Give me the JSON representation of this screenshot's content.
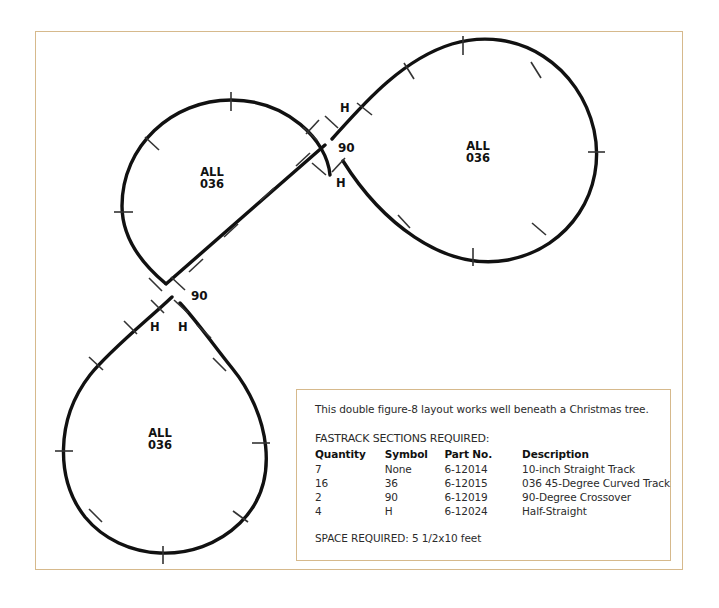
{
  "page": {
    "background": "#ffffff",
    "frame_border_color": "#d6b98c",
    "track_color": "#111111"
  },
  "diagram": {
    "name": "double-figure-8-fastrack-layout",
    "loop_labels": [
      {
        "id": "upper-left-loop",
        "line1": "ALL",
        "line2": "036",
        "x": 200,
        "y": 166
      },
      {
        "id": "upper-right-loop",
        "line1": "ALL",
        "line2": "036",
        "x": 466,
        "y": 140
      },
      {
        "id": "lower-left-loop",
        "line1": "ALL",
        "line2": "036",
        "x": 148,
        "y": 427
      }
    ],
    "crossing_labels": [
      {
        "id": "upper-crossover",
        "text": "90",
        "x": 338,
        "y": 141
      },
      {
        "id": "lower-crossover",
        "text": "90",
        "x": 191,
        "y": 289
      }
    ],
    "half_straight_labels": [
      {
        "id": "h-upper-top",
        "text": "H",
        "x": 340,
        "y": 101
      },
      {
        "id": "h-upper-bottom",
        "text": "H",
        "x": 336,
        "y": 176
      },
      {
        "id": "h-lower-left",
        "text": "H",
        "x": 150,
        "y": 320
      },
      {
        "id": "h-lower-right",
        "text": "H",
        "x": 178,
        "y": 320
      }
    ]
  },
  "legend": {
    "intro": "This double figure-8 layout works well beneath a Christmas tree.",
    "heading": "FASTRACK SECTIONS REQUIRED:",
    "columns": [
      "Quantity",
      "Symbol",
      "Part No.",
      "Description"
    ],
    "rows": [
      {
        "quantity": "7",
        "symbol": "None",
        "part_no": "6-12014",
        "description": "10-inch Straight Track"
      },
      {
        "quantity": "16",
        "symbol": "36",
        "part_no": "6-12015",
        "description": "036 45-Degree Curved Track"
      },
      {
        "quantity": "2",
        "symbol": "90",
        "part_no": "6-12019",
        "description": "90-Degree Crossover"
      },
      {
        "quantity": "4",
        "symbol": "H",
        "part_no": "6-12024",
        "description": "Half-Straight"
      }
    ],
    "space_required": "SPACE REQUIRED: 5 1/2x10 feet"
  }
}
